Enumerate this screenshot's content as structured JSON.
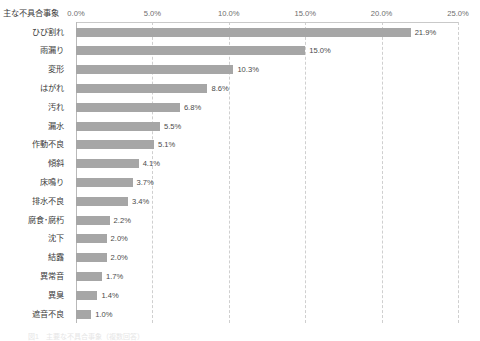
{
  "axis_title": "主な不具合事象",
  "caption": "図1　主要な不具合事象（複数回答）",
  "colors": {
    "bar": "#a6a6a6",
    "gridline": "#cfcfcf",
    "axis_line": "#b9b9b9",
    "label_text": "#3c3c3c",
    "value_text": "#4a4a4a",
    "tick_text": "#6d6d6d",
    "background": "#ffffff"
  },
  "chart_data": {
    "type": "bar",
    "orientation": "horizontal",
    "title": "主な不具合事象",
    "xlabel": "",
    "ylabel": "主な不具合事象",
    "xlim": [
      0,
      25
    ],
    "xticks": [
      0,
      5,
      10,
      15,
      20,
      25
    ],
    "xtick_labels": [
      "0.0%",
      "5.0%",
      "10.0%",
      "15.0%",
      "20.0%",
      "25.0%"
    ],
    "grid": "vertical-dashed",
    "legend": "none",
    "value_label_format": "0.0%",
    "categories": [
      "ひび割れ",
      "雨漏り",
      "変形",
      "はがれ",
      "汚れ",
      "漏水",
      "作動不良",
      "傾斜",
      "床鳴り",
      "排水不良",
      "腐食･腐朽",
      "沈下",
      "結露",
      "異常音",
      "異臭",
      "遮音不良"
    ],
    "values": [
      21.9,
      15.0,
      10.3,
      8.6,
      6.8,
      5.5,
      5.1,
      4.1,
      3.7,
      3.4,
      2.2,
      2.0,
      2.0,
      1.7,
      1.4,
      1.0
    ],
    "value_labels": [
      "21.9%",
      "15.0%",
      "10.3%",
      "8.6%",
      "6.8%",
      "5.5%",
      "5.1%",
      "4.1%",
      "3.7%",
      "3.4%",
      "2.2%",
      "2.0%",
      "2.0%",
      "1.7%",
      "1.4%",
      "1.0%"
    ]
  }
}
